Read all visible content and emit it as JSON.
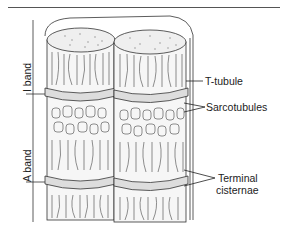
{
  "diagram": {
    "labels": {
      "t_tubule": "T-tubule",
      "sarcotubules": "Sarcotubules",
      "terminal_line1": "Terminal",
      "terminal_line2": "cisternae",
      "i_band": "I band",
      "a_band": "A band"
    },
    "colors": {
      "ink": "#222222",
      "fill": "#f4f4f4",
      "background": "#ffffff"
    }
  }
}
